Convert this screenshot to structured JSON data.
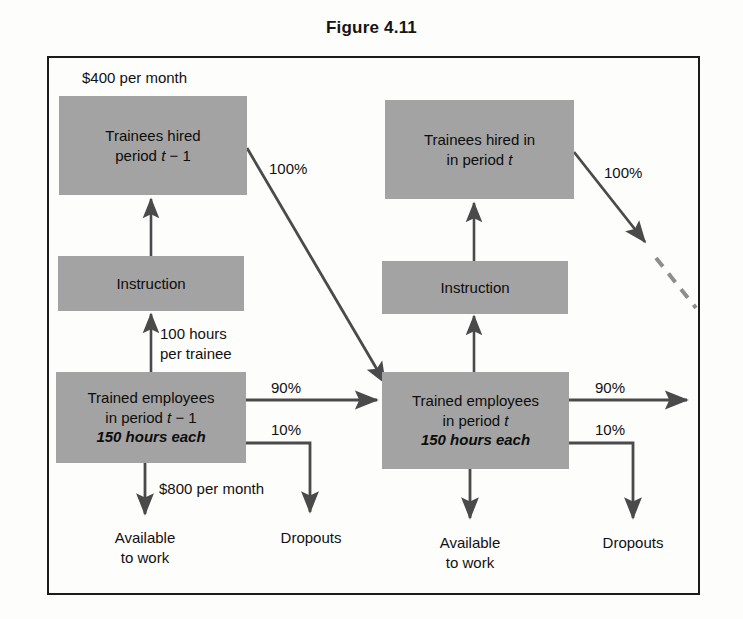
{
  "figure": {
    "title": "Figure 4.11"
  },
  "nodes": {
    "trainees_prev": {
      "line1": "Trainees hired",
      "line2_prefix": "period ",
      "line2_var": "t",
      "line2_suffix": " − 1"
    },
    "trainees_curr": {
      "line1": "Trainees hired in",
      "line2_prefix": "in period ",
      "line2_var": "t",
      "line2_suffix": ""
    },
    "instruction_left": {
      "label": "Instruction"
    },
    "instruction_right": {
      "label": "Instruction"
    },
    "trained_prev": {
      "line1": "Trained employees",
      "line2_prefix": "in period ",
      "line2_var": "t",
      "line2_suffix": " − 1",
      "line3": "150 hours each"
    },
    "trained_curr": {
      "line1": "Trained employees",
      "line2_prefix": "in period ",
      "line2_var": "t",
      "line2_suffix": "",
      "line3": "150 hours each"
    }
  },
  "terminals": {
    "available_left_line1": "Available",
    "available_left_line2": "to work",
    "dropouts_left": "Dropouts",
    "available_right_line1": "Available",
    "available_right_line2": "to work",
    "dropouts_right": "Dropouts"
  },
  "annotations": {
    "cost_trainee": "$400 per month",
    "cost_trained": "$800 per month",
    "hours_line1": "100 hours",
    "hours_line2": "per trainee",
    "pct_100_left": "100%",
    "pct_100_right": "100%",
    "pct_90_left": "90%",
    "pct_90_right": "90%",
    "pct_10_left": "10%",
    "pct_10_right": "10%"
  },
  "colors": {
    "box_fill": "#a3a3a3",
    "line": "#4a4a4a",
    "frame": "#1b1b1b",
    "text": "#0d0d0d",
    "page_bg": "#fdfdfc"
  }
}
